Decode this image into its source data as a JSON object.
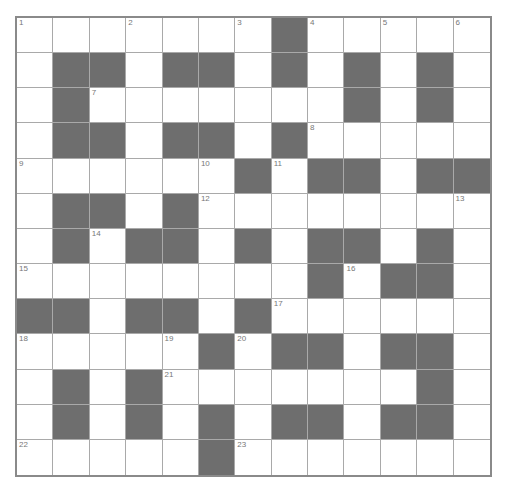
{
  "puzzle": {
    "rows": 13,
    "cols": 13,
    "colors": {
      "block": "#6e6e6e",
      "cell": "#ffffff",
      "gridline": "#a9a9a9",
      "border": "#8a8a8a",
      "number": "#777777"
    },
    "layout": [
      ". . . . . . . # . . . . .",
      ". # # . # # . # . # . # .",
      ". # . . . . . . . # . # .",
      ". # # . # # . # . . . . .",
      ". . . . . . # . # # . # #",
      ". # # . # . . . . . . . .",
      ". # . # # . # . # # . # .",
      ". . . . . . . . # . # # .",
      "# # . # # . # . . . . . .",
      ". . . . . # . # # . # # .",
      ". # . # . . . . . . . # .",
      ". # . # . # . # # . # # .",
      ". . . . . # . . . . . . ."
    ],
    "numbers": [
      {
        "row": 0,
        "col": 0,
        "n": "1"
      },
      {
        "row": 0,
        "col": 3,
        "n": "2"
      },
      {
        "row": 0,
        "col": 6,
        "n": "3"
      },
      {
        "row": 0,
        "col": 8,
        "n": "4"
      },
      {
        "row": 0,
        "col": 10,
        "n": "5"
      },
      {
        "row": 0,
        "col": 12,
        "n": "6"
      },
      {
        "row": 2,
        "col": 2,
        "n": "7"
      },
      {
        "row": 3,
        "col": 8,
        "n": "8"
      },
      {
        "row": 4,
        "col": 0,
        "n": "9"
      },
      {
        "row": 4,
        "col": 5,
        "n": "10"
      },
      {
        "row": 4,
        "col": 7,
        "n": "11"
      },
      {
        "row": 5,
        "col": 5,
        "n": "12"
      },
      {
        "row": 5,
        "col": 12,
        "n": "13"
      },
      {
        "row": 6,
        "col": 2,
        "n": "14"
      },
      {
        "row": 7,
        "col": 0,
        "n": "15"
      },
      {
        "row": 7,
        "col": 9,
        "n": "16"
      },
      {
        "row": 8,
        "col": 7,
        "n": "17"
      },
      {
        "row": 9,
        "col": 0,
        "n": "18"
      },
      {
        "row": 9,
        "col": 4,
        "n": "19"
      },
      {
        "row": 9,
        "col": 6,
        "n": "20"
      },
      {
        "row": 10,
        "col": 4,
        "n": "21"
      },
      {
        "row": 12,
        "col": 0,
        "n": "22"
      },
      {
        "row": 12,
        "col": 6,
        "n": "23"
      }
    ]
  }
}
